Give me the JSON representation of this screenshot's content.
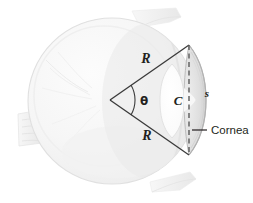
{
  "figure": {
    "background_color": "#ffffff"
  },
  "labels": {
    "radius_upper": "R",
    "radius_lower": "R",
    "angle": "θ",
    "center": "C",
    "arc_length": "s",
    "cornea": "Cornea"
  },
  "colors": {
    "sclera_fill": "#f4f4f4",
    "sclera_edge": "#e2e2e2",
    "sclera_shadow": "#e9e9e9",
    "cornea_fill": "#d9d9d9",
    "cornea_edge": "#b9b9b9",
    "lens_fill": "#fdfdfd",
    "lens_edge": "#dcdcdc",
    "line_color": "#3a3a3a",
    "dashed_color": "#6f6f6f",
    "text_color": "#231f20",
    "muscle_fill": "#f0f0f0",
    "vessel_color": "#e6e6e6"
  },
  "geometry": {
    "eyeball_center_x": 112,
    "eyeball_center_y": 101,
    "eyeball_radius_x": 84,
    "eyeball_radius_y": 83,
    "apex_x": 110,
    "apex_y": 100,
    "chord_x": 189,
    "chord_top_y": 45,
    "chord_bottom_y": 155,
    "cornea_apex_x": 206,
    "angle_arc_radius": 30
  },
  "label_positions": {
    "radius_upper": {
      "x": 146,
      "y": 63
    },
    "radius_lower": {
      "x": 147,
      "y": 137
    },
    "angle": {
      "x": 144,
      "y": 104
    },
    "center": {
      "x": 178,
      "y": 104
    },
    "arc_length": {
      "x": 206,
      "y": 97
    },
    "cornea_text": {
      "x": 210,
      "y": 134
    },
    "cornea_leader_start_x": 192,
    "cornea_leader_end_x": 207,
    "cornea_leader_y": 130
  }
}
